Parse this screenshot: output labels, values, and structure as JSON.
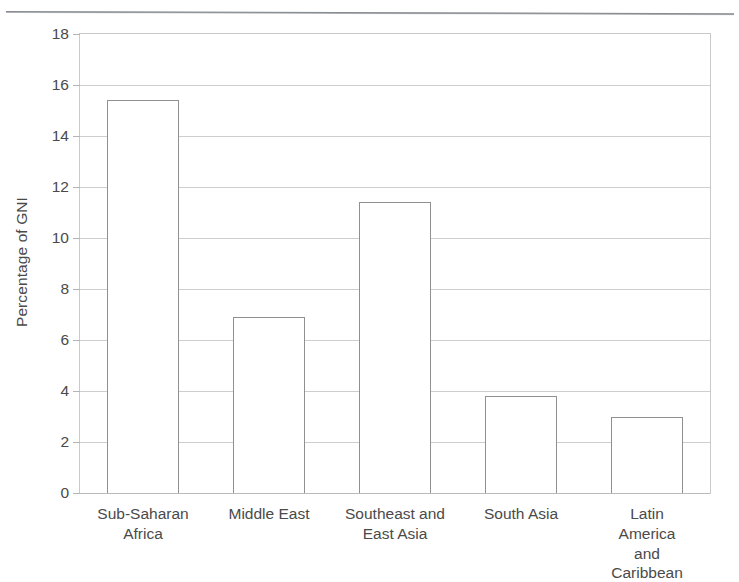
{
  "figure": {
    "background_color": "#ffffff",
    "frame_color": "#c9cacb",
    "gridline_color": "#cdcecf",
    "bar_outline_color": "#8e9092",
    "bar_fill_color": "#ffffff",
    "text_color": "#4a4a4a"
  },
  "chart_data": {
    "type": "bar",
    "title": "",
    "subtitle": "",
    "xlabel": "",
    "ylabel": "Percentage of GNI",
    "categories": [
      "Sub-Saharan\nAfrica",
      "Middle East",
      "Southeast and\nEast Asia",
      "South Asia",
      "Latin America\nand Caribbean"
    ],
    "values": [
      15.4,
      6.9,
      11.4,
      3.8,
      3.0
    ],
    "ylim": [
      0,
      18
    ],
    "ytick_values": [
      0,
      2,
      4,
      6,
      8,
      10,
      12,
      14,
      16,
      18
    ],
    "ytick_labels": [
      "0",
      "2",
      "4",
      "6",
      "8",
      "10",
      "12",
      "14",
      "16",
      "18"
    ],
    "grid": true,
    "grid_axis": "y",
    "legend": null,
    "legend_position": "none",
    "annotations": []
  }
}
